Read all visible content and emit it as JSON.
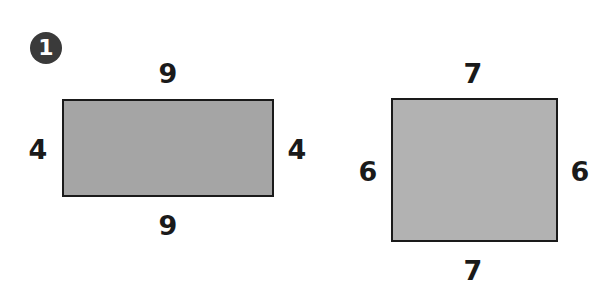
{
  "problem": {
    "number": "1"
  },
  "shapes": [
    {
      "name": "rectangle-1",
      "fill": "#a5a5a5",
      "labels": {
        "top": "9",
        "bottom": "9",
        "left": "4",
        "right": "4"
      }
    },
    {
      "name": "rectangle-2",
      "fill": "#b2b2b2",
      "labels": {
        "top": "7",
        "bottom": "7",
        "left": "6",
        "right": "6"
      }
    }
  ]
}
